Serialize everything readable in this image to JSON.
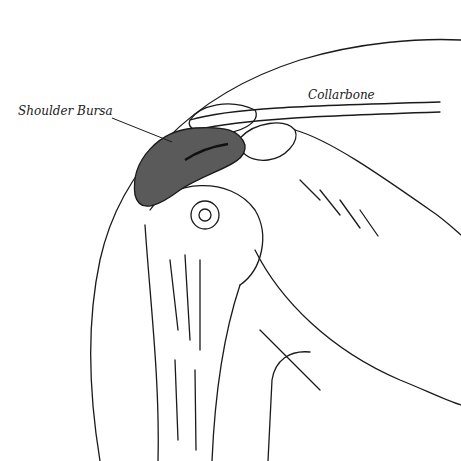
{
  "figure": {
    "labels": {
      "bursa": "Shoulder Bursa",
      "collarbone": "Collarbone"
    },
    "colors": {
      "line": "#1a1a1a",
      "bursa_fill": "#5a5a5a",
      "background": "#ffffff"
    }
  }
}
